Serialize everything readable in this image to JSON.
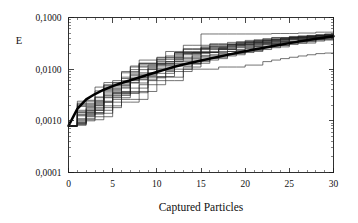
{
  "chart_data": {
    "type": "line",
    "title": "",
    "subtitle": "",
    "xlabel": "Captured Particles",
    "ylabel": "E",
    "xlim": [
      0,
      30
    ],
    "ylim": [
      0.0001,
      0.1
    ],
    "yscale": "log",
    "xscale": "linear",
    "grid": false,
    "legend": false,
    "legend_position": "none",
    "decimal_separator": ",",
    "xticks": [
      0,
      5,
      10,
      15,
      20,
      25,
      30
    ],
    "xtick_labels": [
      "0",
      "5",
      "10",
      "15",
      "20",
      "25",
      "30"
    ],
    "yticks": [
      0.0001,
      0.001,
      0.01,
      0.1
    ],
    "ytick_labels": [
      "0,0001",
      "0,0010",
      "0,0100",
      "0,1000"
    ],
    "x": [
      0,
      1,
      2,
      3,
      4,
      5,
      6,
      7,
      8,
      9,
      10,
      11,
      12,
      13,
      14,
      15,
      16,
      17,
      18,
      19,
      20,
      21,
      22,
      23,
      24,
      25,
      26,
      27,
      28,
      29,
      30
    ],
    "series": [
      {
        "name": "mean",
        "style": "bold",
        "values": [
          0.0008,
          0.0017,
          0.0026,
          0.0033,
          0.004,
          0.0047,
          0.0054,
          0.0061,
          0.0069,
          0.0078,
          0.0088,
          0.0099,
          0.0111,
          0.0123,
          0.0135,
          0.0147,
          0.016,
          0.0174,
          0.0189,
          0.0205,
          0.0222,
          0.024,
          0.0258,
          0.0277,
          0.0298,
          0.0319,
          0.0341,
          0.0364,
          0.0387,
          0.041,
          0.0435
        ]
      },
      {
        "name": "run-01",
        "style": "thin",
        "values": [
          0.0008,
          0.00082,
          0.0025,
          0.0025,
          0.0042,
          0.0042,
          0.007,
          0.007,
          0.007,
          0.012,
          0.012,
          0.012,
          0.019,
          0.019,
          0.019,
          0.048,
          0.048,
          0.048,
          0.048,
          0.048,
          0.048,
          0.048,
          0.048,
          0.049,
          0.049,
          0.049,
          0.05,
          0.05,
          0.052,
          0.052,
          0.054
        ]
      },
      {
        "name": "run-02",
        "style": "thin",
        "values": [
          0.0008,
          0.0015,
          0.0015,
          0.0038,
          0.0038,
          0.0038,
          0.009,
          0.009,
          0.015,
          0.015,
          0.015,
          0.022,
          0.022,
          0.029,
          0.029,
          0.029,
          0.031,
          0.031,
          0.033,
          0.033,
          0.036,
          0.036,
          0.039,
          0.041,
          0.041,
          0.043,
          0.043,
          0.045,
          0.045,
          0.047,
          0.049
        ]
      },
      {
        "name": "run-03",
        "style": "thin",
        "values": [
          0.0008,
          0.0011,
          0.0011,
          0.0023,
          0.0023,
          0.0054,
          0.0054,
          0.0054,
          0.0054,
          0.01,
          0.01,
          0.014,
          0.014,
          0.014,
          0.021,
          0.021,
          0.021,
          0.026,
          0.026,
          0.03,
          0.03,
          0.033,
          0.033,
          0.037,
          0.037,
          0.04,
          0.04,
          0.042,
          0.044,
          0.044,
          0.046
        ]
      },
      {
        "name": "run-04",
        "style": "thin",
        "values": [
          0.0008,
          0.002,
          0.002,
          0.002,
          0.0048,
          0.0048,
          0.0048,
          0.011,
          0.011,
          0.011,
          0.017,
          0.017,
          0.017,
          0.024,
          0.024,
          0.024,
          0.028,
          0.028,
          0.028,
          0.032,
          0.032,
          0.035,
          0.035,
          0.038,
          0.038,
          0.041,
          0.041,
          0.043,
          0.043,
          0.045,
          0.047
        ]
      },
      {
        "name": "run-05",
        "style": "thin",
        "values": [
          0.0008,
          0.0009,
          0.0017,
          0.0017,
          0.0031,
          0.0031,
          0.0031,
          0.0062,
          0.0062,
          0.0062,
          0.0095,
          0.0095,
          0.013,
          0.013,
          0.013,
          0.018,
          0.018,
          0.022,
          0.022,
          0.026,
          0.026,
          0.029,
          0.031,
          0.031,
          0.034,
          0.034,
          0.037,
          0.039,
          0.039,
          0.042,
          0.044
        ]
      },
      {
        "name": "run-06",
        "style": "thin",
        "values": [
          0.0008,
          0.0013,
          0.0013,
          0.0029,
          0.0029,
          0.0029,
          0.0066,
          0.0066,
          0.013,
          0.013,
          0.013,
          0.013,
          0.02,
          0.02,
          0.02,
          0.025,
          0.025,
          0.025,
          0.029,
          0.029,
          0.032,
          0.032,
          0.035,
          0.035,
          0.038,
          0.04,
          0.04,
          0.042,
          0.044,
          0.044,
          0.046
        ]
      },
      {
        "name": "run-07",
        "style": "thin",
        "values": [
          0.0008,
          0.00085,
          0.0014,
          0.0014,
          0.0014,
          0.0035,
          0.0035,
          0.0035,
          0.0035,
          0.0072,
          0.0072,
          0.0072,
          0.0115,
          0.0115,
          0.015,
          0.015,
          0.019,
          0.019,
          0.022,
          0.022,
          0.025,
          0.028,
          0.028,
          0.031,
          0.031,
          0.034,
          0.036,
          0.036,
          0.039,
          0.041,
          0.043
        ]
      },
      {
        "name": "run-08",
        "style": "thin",
        "values": [
          0.0008,
          0.0022,
          0.0022,
          0.0022,
          0.0055,
          0.0055,
          0.0055,
          0.0055,
          0.0125,
          0.0125,
          0.0125,
          0.018,
          0.018,
          0.025,
          0.025,
          0.025,
          0.03,
          0.03,
          0.03,
          0.034,
          0.034,
          0.037,
          0.037,
          0.04,
          0.04,
          0.042,
          0.044,
          0.044,
          0.046,
          0.048,
          0.05
        ]
      },
      {
        "name": "run-09",
        "style": "thin",
        "values": [
          0.0008,
          0.001,
          0.001,
          0.00195,
          0.00195,
          0.00195,
          0.0043,
          0.0043,
          0.0043,
          0.0083,
          0.0083,
          0.0083,
          0.0125,
          0.0125,
          0.0125,
          0.0165,
          0.0165,
          0.02,
          0.02,
          0.023,
          0.023,
          0.027,
          0.027,
          0.03,
          0.033,
          0.033,
          0.036,
          0.038,
          0.038,
          0.041,
          0.043
        ]
      },
      {
        "name": "run-10",
        "style": "thin",
        "values": [
          0.0008,
          0.0016,
          0.0016,
          0.0016,
          0.004,
          0.004,
          0.0085,
          0.0085,
          0.0085,
          0.0085,
          0.014,
          0.014,
          0.014,
          0.02,
          0.02,
          0.02,
          0.024,
          0.024,
          0.027,
          0.027,
          0.03,
          0.03,
          0.033,
          0.033,
          0.036,
          0.038,
          0.038,
          0.041,
          0.041,
          0.043,
          0.045
        ]
      },
      {
        "name": "run-11",
        "style": "thin",
        "values": [
          0.0008,
          0.00095,
          0.0018,
          0.0018,
          0.0018,
          0.0018,
          0.0037,
          0.0037,
          0.0037,
          0.0037,
          0.007,
          0.007,
          0.007,
          0.011,
          0.011,
          0.015,
          0.015,
          0.018,
          0.018,
          0.021,
          0.021,
          0.024,
          0.024,
          0.027,
          0.027,
          0.03,
          0.032,
          0.032,
          0.035,
          0.037,
          0.039
        ]
      },
      {
        "name": "run-12",
        "style": "thin",
        "values": [
          0.0008,
          0.00135,
          0.00135,
          0.00135,
          0.0033,
          0.0033,
          0.0033,
          0.0076,
          0.0076,
          0.0076,
          0.0115,
          0.0115,
          0.016,
          0.016,
          0.016,
          0.021,
          0.021,
          0.024,
          0.024,
          0.028,
          0.028,
          0.031,
          0.031,
          0.034,
          0.034,
          0.037,
          0.039,
          0.039,
          0.042,
          0.042,
          0.044
        ]
      },
      {
        "name": "run-13",
        "style": "thin",
        "values": [
          0.0008,
          0.0024,
          0.0024,
          0.0024,
          0.0024,
          0.006,
          0.006,
          0.006,
          0.013,
          0.013,
          0.013,
          0.013,
          0.021,
          0.021,
          0.021,
          0.021,
          0.028,
          0.028,
          0.028,
          0.032,
          0.032,
          0.035,
          0.035,
          0.038,
          0.038,
          0.041,
          0.041,
          0.044,
          0.044,
          0.047,
          0.049
        ]
      },
      {
        "name": "run-14",
        "style": "thin",
        "values": [
          0.0008,
          0.00105,
          0.00105,
          0.00105,
          0.0023,
          0.0023,
          0.0023,
          0.0023,
          0.005,
          0.005,
          0.005,
          0.009,
          0.009,
          0.009,
          0.013,
          0.013,
          0.016,
          0.016,
          0.019,
          0.019,
          0.022,
          0.022,
          0.026,
          0.026,
          0.029,
          0.032,
          0.032,
          0.035,
          0.037,
          0.037,
          0.04
        ]
      },
      {
        "name": "run-15",
        "style": "thin",
        "values": [
          0.0008,
          0.00088,
          0.0012,
          0.0012,
          0.0012,
          0.0026,
          0.0026,
          0.0026,
          0.0026,
          0.006,
          0.006,
          0.006,
          0.006,
          0.01,
          0.01,
          0.01,
          0.01,
          0.011,
          0.011,
          0.011,
          0.012,
          0.012,
          0.014,
          0.015,
          0.016,
          0.017,
          0.018,
          0.019,
          0.02,
          0.0205,
          0.021
        ]
      },
      {
        "name": "run-16",
        "style": "thin",
        "values": [
          0.0008,
          0.0019,
          0.0019,
          0.0045,
          0.0045,
          0.0045,
          0.0045,
          0.0098,
          0.0098,
          0.0098,
          0.0155,
          0.0155,
          0.0155,
          0.022,
          0.022,
          0.026,
          0.026,
          0.026,
          0.03,
          0.03,
          0.033,
          0.033,
          0.036,
          0.036,
          0.039,
          0.039,
          0.042,
          0.042,
          0.045,
          0.045,
          0.048
        ]
      },
      {
        "name": "run-17",
        "style": "thin",
        "values": [
          0.0008,
          0.00125,
          0.00125,
          0.0028,
          0.0028,
          0.0028,
          0.0028,
          0.0064,
          0.0064,
          0.0105,
          0.0105,
          0.0105,
          0.015,
          0.015,
          0.018,
          0.018,
          0.021,
          0.021,
          0.024,
          0.024,
          0.027,
          0.027,
          0.03,
          0.032,
          0.032,
          0.035,
          0.035,
          0.038,
          0.04,
          0.04,
          0.043
        ]
      },
      {
        "name": "run-18",
        "style": "thin",
        "values": [
          0.0008,
          0.00145,
          0.00145,
          0.00145,
          0.0036,
          0.0036,
          0.0036,
          0.008,
          0.008,
          0.008,
          0.0125,
          0.0125,
          0.017,
          0.017,
          0.017,
          0.022,
          0.022,
          0.025,
          0.025,
          0.029,
          0.029,
          0.032,
          0.032,
          0.035,
          0.035,
          0.038,
          0.038,
          0.041,
          0.041,
          0.044,
          0.046
        ]
      },
      {
        "name": "run-19",
        "style": "thin",
        "values": [
          0.0008,
          0.00092,
          0.0016,
          0.0016,
          0.0016,
          0.0034,
          0.0034,
          0.0034,
          0.0068,
          0.0068,
          0.0068,
          0.01,
          0.01,
          0.01,
          0.014,
          0.014,
          0.017,
          0.017,
          0.02,
          0.02,
          0.023,
          0.023,
          0.026,
          0.029,
          0.029,
          0.032,
          0.034,
          0.034,
          0.037,
          0.039,
          0.041
        ]
      },
      {
        "name": "run-20",
        "style": "thin",
        "values": [
          0.0008,
          0.0021,
          0.0021,
          0.0021,
          0.005,
          0.005,
          0.005,
          0.0115,
          0.0115,
          0.0115,
          0.0165,
          0.0165,
          0.021,
          0.021,
          0.021,
          0.027,
          0.027,
          0.027,
          0.031,
          0.031,
          0.034,
          0.034,
          0.037,
          0.037,
          0.04,
          0.04,
          0.043,
          0.043,
          0.046,
          0.046,
          0.049
        ]
      }
    ]
  },
  "axes": {
    "y_title": "E",
    "x_title": "Captured Particles",
    "x_tick_labels": [
      "0",
      "5",
      "10",
      "15",
      "20",
      "25",
      "30"
    ],
    "y_tick_labels": [
      "0,1000",
      "0,0100",
      "0,0010",
      "0,0001"
    ]
  },
  "colors": {
    "background": "#ffffff",
    "axis": "#1a1a1a",
    "run_line": "#1f1f1f",
    "mean_line": "#000000",
    "text": "#111111"
  }
}
